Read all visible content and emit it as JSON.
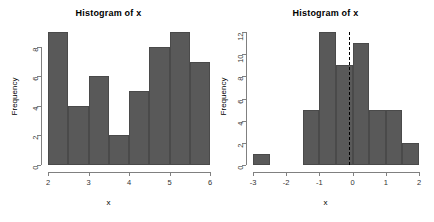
{
  "chart_data": [
    {
      "type": "bar",
      "title": "Histogram of x",
      "xlabel": "x",
      "ylabel": "Frequency",
      "xlim": [
        2.0,
        6.0
      ],
      "ylim": [
        0,
        9
      ],
      "bin_width": 0.5,
      "grid": false,
      "bin_edges": [
        2.0,
        2.5,
        3.0,
        3.5,
        4.0,
        4.5,
        5.0,
        5.5,
        6.0
      ],
      "categories": [
        "2-2.5",
        "2.5-3",
        "3-3.5",
        "3.5-4",
        "4-4.5",
        "4.5-5",
        "5-5.5",
        "5.5-6"
      ],
      "values": [
        9,
        4,
        6,
        2,
        5,
        8,
        9,
        7
      ],
      "xticks": [
        "2",
        "3",
        "4",
        "5",
        "6"
      ],
      "xtick_values": [
        2,
        3,
        4,
        5,
        6
      ],
      "yticks": [
        "0",
        "2",
        "4",
        "6",
        "8"
      ],
      "ytick_values": [
        0,
        2,
        4,
        6,
        8
      ],
      "bar_color": "#595959"
    },
    {
      "type": "bar",
      "title": "Histogram of x",
      "xlabel": "x",
      "ylabel": "Frequency",
      "xlim": [
        -3.0,
        2.0
      ],
      "ylim": [
        0,
        12
      ],
      "bin_width": 0.5,
      "grid": false,
      "bin_edges": [
        -3.0,
        -2.5,
        -2.0,
        -1.5,
        -1.0,
        -0.5,
        0.0,
        0.5,
        1.0,
        1.5,
        2.0
      ],
      "categories": [
        "-3 to -2.5",
        "-2.5 to -2",
        "-2 to -1.5",
        "-1.5 to -1",
        "-1 to -0.5",
        "-0.5 to 0",
        "0 to 0.5",
        "0.5 to 1",
        "1 to 1.5",
        "1.5 to 2"
      ],
      "values": [
        1,
        0,
        0,
        5,
        12,
        9,
        11,
        5,
        5,
        2
      ],
      "xticks": [
        "-3",
        "-2",
        "-1",
        "0",
        "1",
        "2"
      ],
      "xtick_values": [
        -3,
        -2,
        -1,
        0,
        1,
        2
      ],
      "yticks": [
        "0",
        "2",
        "4",
        "6",
        "8",
        "10",
        "12"
      ],
      "ytick_values": [
        0,
        2,
        4,
        6,
        8,
        10,
        12
      ],
      "bar_color": "#595959",
      "annotations": [
        {
          "type": "vline",
          "value": -0.1,
          "style": "dashed",
          "color": "#000000"
        }
      ]
    }
  ]
}
